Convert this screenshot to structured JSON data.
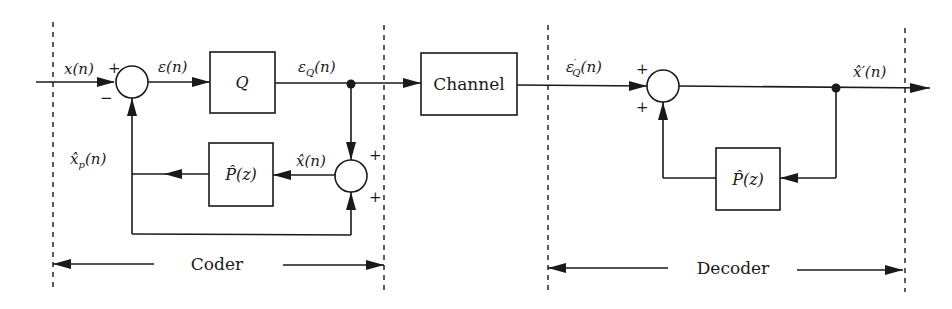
{
  "diagram": {
    "sections": {
      "coder": {
        "label": "Coder"
      },
      "decoder": {
        "label": "Decoder"
      }
    },
    "blocks": {
      "quantizer": {
        "label": "Q"
      },
      "channel": {
        "label": "Channel"
      },
      "coder_predictor": {
        "label": "P̂(z)"
      },
      "decoder_predictor": {
        "label": "P̂(z)"
      }
    },
    "signals": {
      "input": "x(n)",
      "error": "ε(n)",
      "quantized_error": "ε_Q(n)",
      "reconstructed": "x̂(n)",
      "prediction": "x̂_p(n)",
      "received_error": "ε′_Q(n)",
      "output": "x̂′(n)"
    },
    "signs": {
      "sum1_top": "+",
      "sum1_bottom": "−",
      "sum2_top": "+",
      "sum2_bottom": "+",
      "sum3_top": "+",
      "sum3_bottom": "+"
    },
    "colors": {
      "ink": "#1a1a1a",
      "background": "#ffffff"
    }
  }
}
